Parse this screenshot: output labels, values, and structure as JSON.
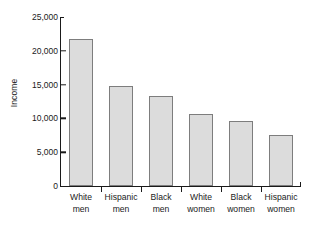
{
  "chart_data": {
    "type": "bar",
    "title": "",
    "xlabel": "",
    "ylabel": "Income",
    "categories": [
      "White men",
      "Hispanic men",
      "Black men",
      "White women",
      "Black women",
      "Hispanic women"
    ],
    "category_lines": [
      [
        "White",
        "men"
      ],
      [
        "Hispanic",
        "men"
      ],
      [
        "Black",
        "men"
      ],
      [
        "White",
        "women"
      ],
      [
        "Black",
        "women"
      ],
      [
        "Hispanic",
        "women"
      ]
    ],
    "values": [
      21800,
      14850,
      13250,
      10650,
      9600,
      7550
    ],
    "ylim": [
      0,
      25000
    ],
    "yticks": [
      0,
      5000,
      10000,
      15000,
      20000,
      25000
    ],
    "ytick_labels": [
      "0",
      "5,000",
      "10,000",
      "15,000",
      "20,000",
      "25,000"
    ],
    "grid": false,
    "legend": false,
    "bar_fill_color": "#dcdcdc",
    "bar_border_color": "#7d7d7d",
    "axis_color": "#1a1a1a"
  }
}
